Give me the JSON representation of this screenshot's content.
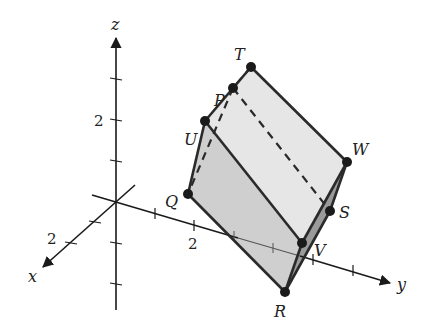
{
  "diagram": {
    "type": "3d-prism-in-coordinate-axes",
    "axes": {
      "x": {
        "label": "x",
        "tick_label": "2"
      },
      "y": {
        "label": "y",
        "tick_label": "2"
      },
      "z": {
        "label": "z",
        "tick_label": "2"
      }
    },
    "vertices": [
      {
        "name": "T",
        "label": "T"
      },
      {
        "name": "P",
        "label": "P"
      },
      {
        "name": "U",
        "label": "U"
      },
      {
        "name": "Q",
        "label": "Q"
      },
      {
        "name": "W",
        "label": "W"
      },
      {
        "name": "S",
        "label": "S"
      },
      {
        "name": "V",
        "label": "V"
      },
      {
        "name": "R",
        "label": "R"
      }
    ],
    "colors": {
      "top_face": "#e6e6e6",
      "front_face": "#cfcfcf",
      "side_face": "#9a9a9a",
      "edges": "#2a2a2a",
      "vertex_dot": "#1a1a1a"
    }
  }
}
